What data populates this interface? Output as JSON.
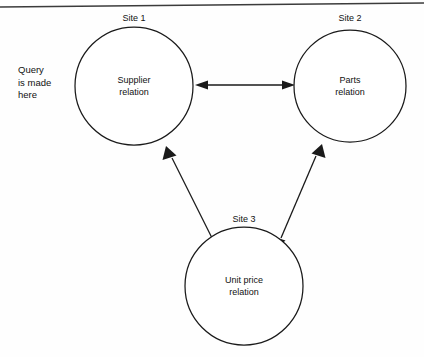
{
  "figure": {
    "frame": {
      "top_rule": true
    },
    "note": {
      "line1": "Query",
      "line2": "is made",
      "line3": "here"
    },
    "nodes": [
      {
        "id": "site-1",
        "site_label": "Site 1",
        "relation_line1": "Supplier",
        "relation_line2": "relation",
        "cx": 134,
        "cy": 86,
        "r": 59
      },
      {
        "id": "site-2",
        "site_label": "Site 2",
        "relation_line1": "Parts",
        "relation_line2": "relation",
        "cx": 350,
        "cy": 86,
        "r": 56
      },
      {
        "id": "site-3",
        "site_label": "Site 3",
        "relation_line1": "Unit price",
        "relation_line2": "relation",
        "cx": 244,
        "cy": 286,
        "r": 59
      }
    ],
    "connectors": [
      {
        "id": "site1-site2",
        "from": "site-1",
        "to": "site-2",
        "double_headed": true
      },
      {
        "id": "site1-site3",
        "from": "site-1",
        "to": "site-3",
        "double_headed": true
      },
      {
        "id": "site2-site3",
        "from": "site-2",
        "to": "site-3",
        "double_headed": true
      }
    ],
    "colors": {
      "ink": "#1a1a1a",
      "paper": "#fefefe",
      "frame": "#3b3b3b"
    }
  }
}
